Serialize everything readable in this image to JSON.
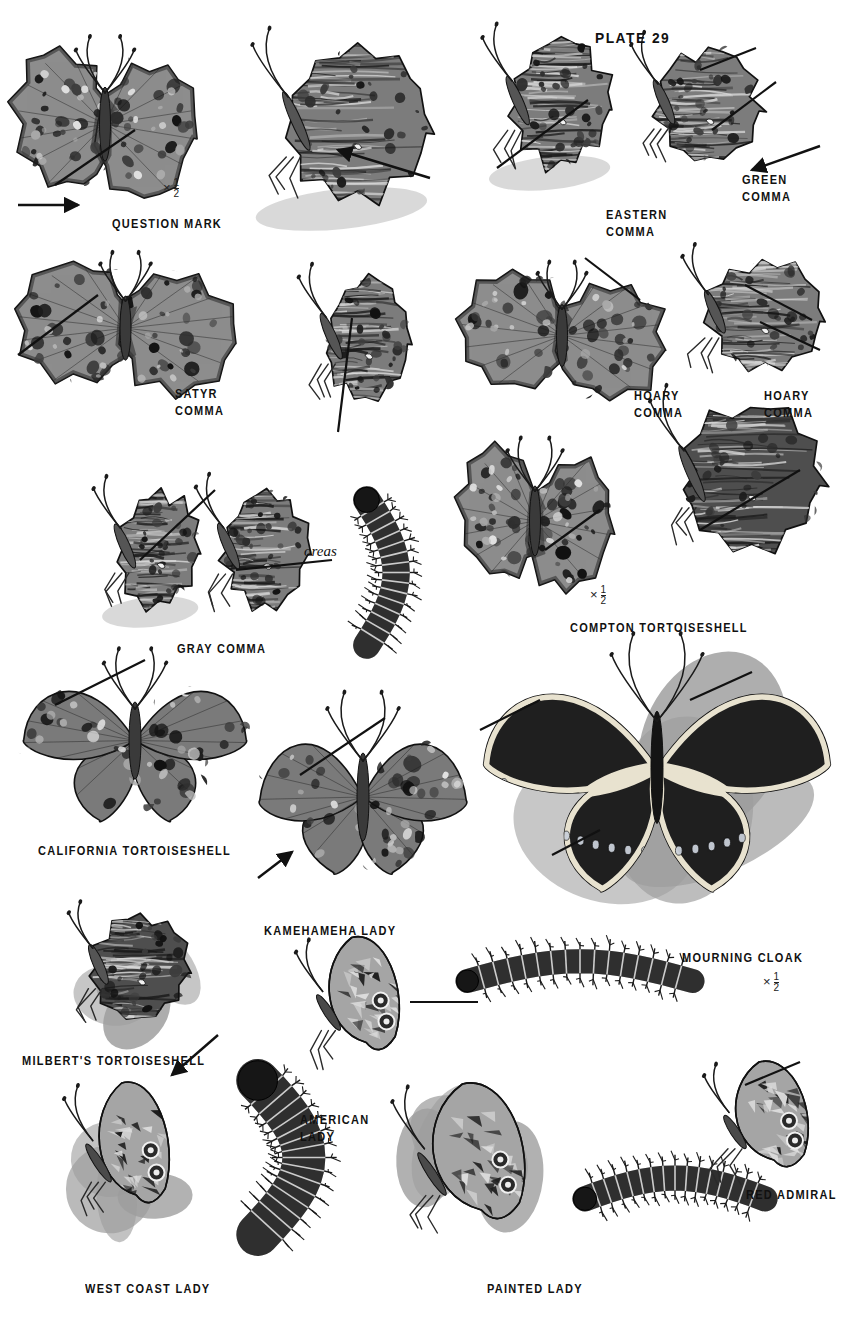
{
  "plate": {
    "header": "PLATE 29",
    "background_color": "#ffffff",
    "ink_color": "#111111",
    "width": 853,
    "height": 1338
  },
  "labels": [
    {
      "id": "question-mark",
      "text": "QUESTION MARK",
      "x": 112,
      "y": 216,
      "align": "left"
    },
    {
      "id": "eastern-comma",
      "text": "EASTERN\nCOMMA",
      "x": 606,
      "y": 207,
      "align": "left"
    },
    {
      "id": "green-comma",
      "text": "GREEN\nCOMMA",
      "x": 742,
      "y": 172,
      "align": "left"
    },
    {
      "id": "satyr-comma",
      "text": "SATYR\nCOMMA",
      "x": 175,
      "y": 386,
      "align": "left"
    },
    {
      "id": "hoary-comma-dorsal",
      "text": "HOARY\nCOMMA",
      "x": 634,
      "y": 388,
      "align": "left"
    },
    {
      "id": "hoary-comma-ventral",
      "text": "HOARY\nCOMMA",
      "x": 764,
      "y": 388,
      "align": "left"
    },
    {
      "id": "gray-comma",
      "text": "GRAY COMMA",
      "x": 177,
      "y": 641,
      "align": "left"
    },
    {
      "id": "compton-tortoiseshell",
      "text": "COMPTON TORTOISESHELL",
      "x": 570,
      "y": 620,
      "align": "left"
    },
    {
      "id": "california-tortoiseshell",
      "text": "CALIFORNIA TORTOISESHELL",
      "x": 38,
      "y": 843,
      "align": "left"
    },
    {
      "id": "kamehameha-lady",
      "text": "KAMEHAMEHA LADY",
      "x": 264,
      "y": 923,
      "align": "left"
    },
    {
      "id": "mourning-cloak",
      "text": "MOURNING CLOAK",
      "x": 682,
      "y": 950,
      "align": "left"
    },
    {
      "id": "milberts-tortoiseshell",
      "text": "MILBERT'S TORTOISESHELL",
      "x": 22,
      "y": 1053,
      "align": "left"
    },
    {
      "id": "american-lady",
      "text": "AMERICAN\nLADY",
      "x": 300,
      "y": 1112,
      "align": "left"
    },
    {
      "id": "red-admiral",
      "text": "RED ADMIRAL",
      "x": 746,
      "y": 1187,
      "align": "left"
    },
    {
      "id": "west-coast-lady",
      "text": "WEST COAST LADY",
      "x": 85,
      "y": 1281,
      "align": "left"
    },
    {
      "id": "painted-lady",
      "text": "PAINTED LADY",
      "x": 487,
      "y": 1281,
      "align": "left"
    }
  ],
  "scale_notes": [
    {
      "id": "question-mark-scale",
      "symbol": "×",
      "numerator": "1",
      "denominator": "2",
      "x": 163,
      "y": 178
    },
    {
      "id": "compton-scale",
      "symbol": "×",
      "numerator": "1",
      "denominator": "2",
      "x": 590,
      "y": 585
    },
    {
      "id": "mourning-cloak-scale",
      "symbol": "×",
      "numerator": "1",
      "denominator": "2",
      "x": 763,
      "y": 972
    }
  ],
  "annotations": [
    {
      "id": "oreas-subspecies",
      "text": "oreas",
      "style": "italic-serif",
      "x": 304,
      "y": 543
    }
  ],
  "figures": [
    {
      "id": "question-mark-dorsal",
      "common_name": "Question Mark",
      "view": "dorsal",
      "x": 10,
      "y": 28,
      "w": 190,
      "h": 185
    },
    {
      "id": "question-mark-ventral",
      "common_name": "Question Mark",
      "view": "ventral",
      "x": 243,
      "y": 33,
      "w": 205,
      "h": 200
    },
    {
      "id": "eastern-comma-ventral",
      "common_name": "Eastern Comma",
      "view": "ventral",
      "x": 480,
      "y": 28,
      "w": 145,
      "h": 165
    },
    {
      "id": "green-comma-ventral",
      "common_name": "Green Comma",
      "view": "ventral",
      "x": 625,
      "y": 36,
      "w": 150,
      "h": 150
    },
    {
      "id": "satyr-comma-dorsal",
      "common_name": "Satyr Comma",
      "view": "dorsal",
      "x": 8,
      "y": 245,
      "w": 235,
      "h": 160
    },
    {
      "id": "satyr-comma-ventral",
      "common_name": "Satyr Comma",
      "view": "ventral",
      "x": 300,
      "y": 268,
      "w": 120,
      "h": 155
    },
    {
      "id": "hoary-comma-dorsal",
      "common_name": "Hoary Comma",
      "view": "dorsal",
      "x": 452,
      "y": 255,
      "w": 220,
      "h": 155
    },
    {
      "id": "hoary-comma-ventral",
      "common_name": "Hoary Comma",
      "view": "ventral",
      "x": 672,
      "y": 248,
      "w": 165,
      "h": 145
    },
    {
      "id": "gray-comma-ventral-a",
      "common_name": "Gray Comma",
      "view": "ventral",
      "x": 95,
      "y": 480,
      "w": 115,
      "h": 150
    },
    {
      "id": "gray-comma-ventral-b",
      "common_name": "Gray Comma",
      "view": "ventral",
      "x": 196,
      "y": 478,
      "w": 125,
      "h": 155
    },
    {
      "id": "gray-comma-caterpillar",
      "common_name": "Gray Comma",
      "view": "larva",
      "x": 330,
      "y": 490,
      "w": 105,
      "h": 165
    },
    {
      "id": "compton-tortoiseshell-dorsal",
      "common_name": "Compton Tortoiseshell",
      "view": "dorsal",
      "x": 455,
      "y": 430,
      "w": 160,
      "h": 175
    },
    {
      "id": "compton-tortoiseshell-ventral",
      "common_name": "Compton Tortoiseshell",
      "view": "ventral",
      "x": 640,
      "y": 390,
      "w": 200,
      "h": 190
    },
    {
      "id": "california-tortoiseshell-dorsal",
      "common_name": "California Tortoiseshell",
      "view": "dorsal",
      "x": 10,
      "y": 660,
      "w": 250,
      "h": 175
    },
    {
      "id": "kamehameha-lady-dorsal",
      "common_name": "Kamehameha Lady",
      "view": "dorsal",
      "x": 248,
      "y": 705,
      "w": 230,
      "h": 200
    },
    {
      "id": "mourning-cloak-dorsal",
      "common_name": "Mourning Cloak",
      "view": "dorsal",
      "x": 462,
      "y": 650,
      "w": 390,
      "h": 255
    },
    {
      "id": "mourning-cloak-caterpillar",
      "common_name": "Mourning Cloak",
      "view": "larva",
      "x": 455,
      "y": 925,
      "w": 250,
      "h": 100
    },
    {
      "id": "milberts-tortoiseshell-ventral",
      "common_name": "Milbert's Tortoiseshell",
      "view": "ventral",
      "x": 62,
      "y": 905,
      "w": 140,
      "h": 135
    },
    {
      "id": "american-lady-ventral",
      "common_name": "American Lady",
      "view": "ventral",
      "x": 285,
      "y": 930,
      "w": 145,
      "h": 150
    },
    {
      "id": "west-coast-lady-ventral",
      "common_name": "West Coast Lady",
      "view": "ventral",
      "x": 55,
      "y": 1075,
      "w": 145,
      "h": 160
    },
    {
      "id": "west-coast-lady-caterpillar",
      "common_name": "West Coast Lady",
      "view": "larva",
      "x": 200,
      "y": 1070,
      "w": 165,
      "h": 175
    },
    {
      "id": "painted-lady-ventral",
      "common_name": "Painted Lady",
      "view": "ventral",
      "x": 375,
      "y": 1075,
      "w": 190,
      "h": 180
    },
    {
      "id": "painted-lady-caterpillar",
      "common_name": "Painted Lady",
      "view": "larva",
      "x": 575,
      "y": 1140,
      "w": 200,
      "h": 105
    },
    {
      "id": "red-admiral-ventral",
      "common_name": "Red Admiral",
      "view": "ventral",
      "x": 690,
      "y": 1055,
      "w": 150,
      "h": 140
    }
  ],
  "pointers": [
    {
      "id": "pointer-question-mark-hook",
      "type": "line",
      "x1": 55,
      "y1": 185,
      "x2": 135,
      "y2": 130
    },
    {
      "id": "pointer-question-mark-tail",
      "type": "arrow",
      "x1": 18,
      "y1": 205,
      "x2": 78,
      "y2": 205
    },
    {
      "id": "pointer-question-mark-silver",
      "type": "arrow",
      "x1": 430,
      "y1": 178,
      "x2": 338,
      "y2": 150
    },
    {
      "id": "pointer-eastern-comma",
      "type": "line",
      "x1": 497,
      "y1": 168,
      "x2": 588,
      "y2": 100
    },
    {
      "id": "pointer-green-comma-a",
      "type": "line",
      "x1": 700,
      "y1": 70,
      "x2": 756,
      "y2": 48
    },
    {
      "id": "pointer-green-comma-b",
      "type": "line",
      "x1": 712,
      "y1": 130,
      "x2": 776,
      "y2": 82
    },
    {
      "id": "pointer-green-comma-c",
      "type": "arrow",
      "x1": 820,
      "y1": 146,
      "x2": 752,
      "y2": 170
    },
    {
      "id": "pointer-satyr-comma",
      "type": "line",
      "x1": 18,
      "y1": 355,
      "x2": 98,
      "y2": 295
    },
    {
      "id": "pointer-satyr-ventral",
      "type": "line",
      "x1": 338,
      "y1": 432,
      "x2": 352,
      "y2": 318
    },
    {
      "id": "pointer-hoary-dorsal",
      "type": "line",
      "x1": 585,
      "y1": 258,
      "x2": 640,
      "y2": 300
    },
    {
      "id": "pointer-hoary-ventral",
      "type": "line",
      "x1": 745,
      "y1": 285,
      "x2": 812,
      "y2": 320
    },
    {
      "id": "pointer-hoary-ventral-b",
      "type": "line",
      "x1": 760,
      "y1": 322,
      "x2": 820,
      "y2": 350
    },
    {
      "id": "pointer-gray-comma-a",
      "type": "line",
      "x1": 140,
      "y1": 560,
      "x2": 215,
      "y2": 490
    },
    {
      "id": "pointer-oreas",
      "type": "line",
      "x1": 236,
      "y1": 570,
      "x2": 332,
      "y2": 560
    },
    {
      "id": "pointer-compton",
      "type": "line",
      "x1": 545,
      "y1": 550,
      "x2": 600,
      "y2": 510
    },
    {
      "id": "pointer-compton-ventral",
      "type": "line",
      "x1": 700,
      "y1": 530,
      "x2": 800,
      "y2": 470
    },
    {
      "id": "pointer-california",
      "type": "line",
      "x1": 55,
      "y1": 705,
      "x2": 145,
      "y2": 660
    },
    {
      "id": "pointer-kamehameha-upper",
      "type": "line",
      "x1": 300,
      "y1": 775,
      "x2": 385,
      "y2": 718
    },
    {
      "id": "pointer-kamehameha-lower",
      "type": "arrow",
      "x1": 258,
      "y1": 878,
      "x2": 292,
      "y2": 852
    },
    {
      "id": "pointer-mourning-upper",
      "type": "line",
      "x1": 480,
      "y1": 730,
      "x2": 540,
      "y2": 700
    },
    {
      "id": "pointer-mourning-right",
      "type": "line",
      "x1": 690,
      "y1": 700,
      "x2": 752,
      "y2": 672
    },
    {
      "id": "pointer-mourning-lower",
      "type": "line",
      "x1": 552,
      "y1": 855,
      "x2": 600,
      "y2": 830
    },
    {
      "id": "pointer-milberts",
      "type": "arrow",
      "x1": 218,
      "y1": 1035,
      "x2": 172,
      "y2": 1075
    },
    {
      "id": "pointer-american-lady",
      "type": "line",
      "x1": 410,
      "y1": 1002,
      "x2": 478,
      "y2": 1002
    },
    {
      "id": "pointer-red-admiral",
      "type": "line",
      "x1": 745,
      "y1": 1085,
      "x2": 800,
      "y2": 1062
    }
  ]
}
